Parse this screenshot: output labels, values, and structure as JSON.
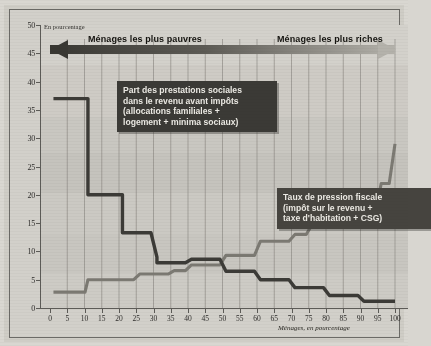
{
  "unit_note": "En pourcentage",
  "band": {
    "left_label": "Ménages les plus pauvres",
    "right_label": "Ménages les plus riches"
  },
  "callouts": {
    "prestations": "Part des prestations sociales\ndans le revenu avant impôts\n(allocations familiales +\nlogement + minima sociaux)",
    "fiscale": "Taux de pression fiscale\n(impôt sur le revenu +\ntaxe d'habitation + CSG)"
  },
  "colors": {
    "prestations_line": "#3c3b37",
    "fiscale_line": "#7c7a73",
    "plot_background": "#cbc9c3",
    "band_dark": "#3d3c38",
    "band_light": "#a9a7a0",
    "frame": "#6b6a66",
    "callout_background": "#3b3a36"
  },
  "chart_data": {
    "type": "line",
    "title": "",
    "subtitle": "",
    "xlabel": "Ménages, en pourcentage",
    "ylabel": "En pourcentage",
    "xlim": [
      0,
      100
    ],
    "ylim": [
      0,
      50
    ],
    "xticks": [
      0,
      5,
      10,
      15,
      20,
      25,
      30,
      35,
      40,
      45,
      50,
      55,
      60,
      65,
      70,
      75,
      80,
      85,
      90,
      95,
      100
    ],
    "yticks": [
      0,
      5,
      10,
      15,
      20,
      25,
      30,
      35,
      40,
      45,
      50
    ],
    "grid": "vertical",
    "legend": "annotated-callouts",
    "step": "post",
    "series": [
      {
        "name": "Part des prestations sociales dans le revenu avant impôts",
        "color": "#3c3b37",
        "x": [
          1,
          11,
          11,
          21,
          21,
          26,
          26,
          31,
          31,
          36,
          41,
          46,
          51,
          56,
          61,
          66,
          71,
          76,
          81,
          86,
          91,
          96,
          100
        ],
        "values": [
          37,
          37,
          20,
          20,
          13.3,
          13.3,
          13.3,
          9,
          8,
          8,
          8.6,
          8.6,
          6.5,
          6.5,
          5,
          5,
          3.6,
          3.6,
          2.2,
          2.2,
          1.2,
          1.2,
          1.2
        ]
      },
      {
        "name": "Taux de pression fiscale (impôt sur le revenu + taxe d'habitation + CSG)",
        "color": "#7c7a73",
        "x": [
          1,
          9,
          11,
          21,
          26,
          31,
          36,
          41,
          46,
          51,
          56,
          61,
          66,
          71,
          76,
          81,
          86,
          91,
          96,
          100
        ],
        "values": [
          2.8,
          2.8,
          5,
          5,
          6,
          6,
          6.6,
          7.6,
          7.6,
          9.3,
          9.3,
          11.8,
          11.8,
          13,
          14.8,
          14.8,
          14.8,
          16.5,
          22,
          29
        ]
      }
    ]
  }
}
